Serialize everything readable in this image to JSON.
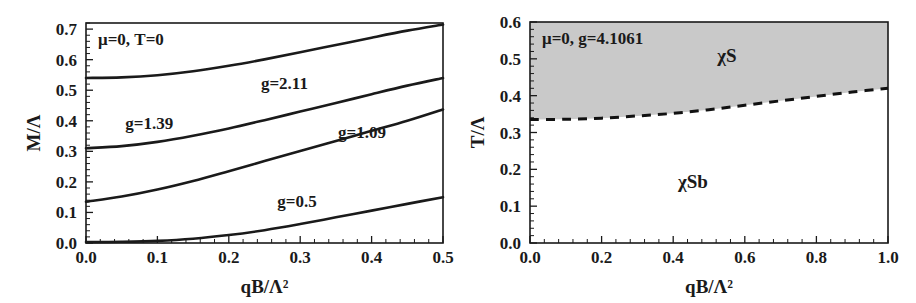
{
  "figure": {
    "background_color": "#ffffff",
    "ink_color": "#1a1a1a",
    "shade_color": "#c9c9c9"
  },
  "chart_data": [
    {
      "type": "line",
      "panel": "left",
      "title": "",
      "annotation": "μ=0, T=0",
      "xlabel": "qB/Λ²",
      "ylabel": "M/Λ",
      "xlim": [
        0.0,
        0.5
      ],
      "ylim": [
        0.0,
        0.72
      ],
      "xticks": [
        "0.0",
        "0.1",
        "0.2",
        "0.3",
        "0.4",
        "0.5"
      ],
      "xtick_values": [
        0.0,
        0.1,
        0.2,
        0.3,
        0.4,
        0.5
      ],
      "yticks": [
        "0.0",
        "0.1",
        "0.2",
        "0.3",
        "0.4",
        "0.5",
        "0.6",
        "0.7"
      ],
      "ytick_values": [
        0.0,
        0.1,
        0.2,
        0.3,
        0.4,
        0.5,
        0.6,
        0.7
      ],
      "grid": false,
      "legend": "inline-labels",
      "x": [
        0.0,
        0.05,
        0.1,
        0.15,
        0.2,
        0.25,
        0.3,
        0.35,
        0.4,
        0.45,
        0.5
      ],
      "series": [
        {
          "name": "g=2.11",
          "label": "g=2.11",
          "label_x": 0.245,
          "label_y": 0.505,
          "values": [
            0.54,
            0.542,
            0.549,
            0.562,
            0.58,
            0.601,
            0.624,
            0.648,
            0.672,
            0.695,
            0.715
          ]
        },
        {
          "name": "g=1.39",
          "label": "g=1.39",
          "label_x": 0.055,
          "label_y": 0.372,
          "values": [
            0.31,
            0.317,
            0.331,
            0.351,
            0.375,
            0.402,
            0.43,
            0.458,
            0.487,
            0.515,
            0.54
          ]
        },
        {
          "name": "g=1.09",
          "label": "g=1.09",
          "label_x": 0.353,
          "label_y": 0.345,
          "values": [
            0.135,
            0.152,
            0.175,
            0.203,
            0.235,
            0.268,
            0.301,
            0.334,
            0.367,
            0.4,
            0.437
          ]
        },
        {
          "name": "g=0.5",
          "label": "g=0.5",
          "label_x": 0.268,
          "label_y": 0.118,
          "values": [
            0.003,
            0.004,
            0.007,
            0.014,
            0.026,
            0.042,
            0.062,
            0.084,
            0.106,
            0.128,
            0.15
          ]
        }
      ]
    },
    {
      "type": "area",
      "panel": "right",
      "title": "",
      "annotation": "μ=0, g=4.1061",
      "xlabel": "qB/Λ²",
      "ylabel": "T/Λ",
      "xlim": [
        0.0,
        1.0
      ],
      "ylim": [
        0.0,
        0.6
      ],
      "xticks": [
        "0.0",
        "0.2",
        "0.4",
        "0.6",
        "0.8",
        "1.0"
      ],
      "xtick_values": [
        0.0,
        0.2,
        0.4,
        0.6,
        0.8,
        1.0
      ],
      "yticks": [
        "0.0",
        "0.1",
        "0.2",
        "0.3",
        "0.4",
        "0.5",
        "0.6"
      ],
      "ytick_values": [
        0.0,
        0.1,
        0.2,
        0.3,
        0.4,
        0.5,
        0.6
      ],
      "grid": false,
      "legend": "region-labels",
      "boundary": {
        "name": "phase-boundary",
        "style": "dashed",
        "x": [
          0.0,
          0.1,
          0.2,
          0.3,
          0.4,
          0.5,
          0.6,
          0.7,
          0.8,
          0.9,
          1.0
        ],
        "values": [
          0.335,
          0.336,
          0.339,
          0.345,
          0.352,
          0.362,
          0.374,
          0.386,
          0.398,
          0.41,
          0.42
        ]
      },
      "regions": [
        {
          "name": "chi-S",
          "label": "χS",
          "label_x": 0.55,
          "label_y": 0.492,
          "shaded": true
        },
        {
          "name": "chi-Sb",
          "label": "χSb",
          "label_x": 0.455,
          "label_y": 0.148,
          "shaded": false
        }
      ]
    }
  ]
}
